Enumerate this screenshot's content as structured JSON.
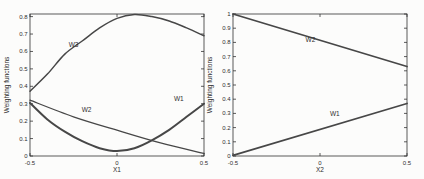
{
  "figure": {
    "background": "#fcfcfb",
    "axis_color": "#333333",
    "curve_color": "#474747",
    "text_color": "#2e2e2e"
  },
  "chart_data": [
    {
      "type": "line",
      "title": "",
      "xlabel": "X1",
      "ylabel": "Weighting functions",
      "xlim": [
        -0.5,
        0.5
      ],
      "ylim": [
        0,
        0.815
      ],
      "grid": false,
      "legend": "none",
      "xticks": [
        {
          "v": -0.5,
          "label": "-0.5"
        },
        {
          "v": 0,
          "label": "0"
        },
        {
          "v": 0.5,
          "label": "0.5"
        }
      ],
      "yticks": [
        {
          "v": 0,
          "label": "0"
        },
        {
          "v": 0.1,
          "label": "0.1"
        },
        {
          "v": 0.2,
          "label": "0.2"
        },
        {
          "v": 0.3,
          "label": "0.3"
        },
        {
          "v": 0.4,
          "label": "0.4"
        },
        {
          "v": 0.5,
          "label": "0.5"
        },
        {
          "v": 0.6,
          "label": "0.6"
        },
        {
          "v": 0.7,
          "label": "0.7"
        },
        {
          "v": 0.8,
          "label": "0.8"
        }
      ],
      "series": [
        {
          "name": "W3",
          "lw": 1.5,
          "x": [
            -0.5,
            -0.4,
            -0.3,
            -0.2,
            -0.1,
            0,
            0.1,
            0.2,
            0.3,
            0.4,
            0.5
          ],
          "y": [
            0.372,
            0.47,
            0.585,
            0.66,
            0.735,
            0.79,
            0.812,
            0.8,
            0.775,
            0.735,
            0.69
          ]
        },
        {
          "name": "W2",
          "lw": 1.3,
          "x": [
            -0.5,
            -0.25,
            0,
            0.25,
            0.5
          ],
          "y": [
            0.32,
            0.225,
            0.148,
            0.075,
            0.015
          ]
        },
        {
          "name": "W1",
          "lw": 2,
          "x": [
            -0.5,
            -0.4,
            -0.3,
            -0.2,
            -0.1,
            0,
            0.1,
            0.2,
            0.3,
            0.4,
            0.5
          ],
          "y": [
            0.305,
            0.21,
            0.14,
            0.085,
            0.045,
            0.028,
            0.045,
            0.09,
            0.15,
            0.225,
            0.3
          ]
        }
      ],
      "annotations": [
        {
          "text": "W3",
          "x": -0.25,
          "y": 0.625
        },
        {
          "text": "W2",
          "x": -0.175,
          "y": 0.25
        },
        {
          "text": "W1",
          "x": 0.355,
          "y": 0.315
        }
      ]
    },
    {
      "type": "line",
      "title": "",
      "xlabel": "X2",
      "ylabel": "Weighting functions",
      "xlim": [
        -0.5,
        0.5
      ],
      "ylim": [
        0,
        1
      ],
      "grid": false,
      "legend": "none",
      "xticks": [
        {
          "v": -0.5,
          "label": "-0.5"
        },
        {
          "v": 0,
          "label": "0"
        },
        {
          "v": 0.5,
          "label": "0.5"
        }
      ],
      "yticks": [
        {
          "v": 0,
          "label": "0"
        },
        {
          "v": 0.1,
          "label": "0.1"
        },
        {
          "v": 0.2,
          "label": "0.2"
        },
        {
          "v": 0.3,
          "label": "0.3"
        },
        {
          "v": 0.4,
          "label": "0.4"
        },
        {
          "v": 0.5,
          "label": "0.5"
        },
        {
          "v": 0.6,
          "label": "0.6"
        },
        {
          "v": 0.7,
          "label": "0.7"
        },
        {
          "v": 0.8,
          "label": "0.8"
        },
        {
          "v": 0.9,
          "label": "0.9"
        },
        {
          "v": 1,
          "label": "1"
        }
      ],
      "series": [
        {
          "name": "W2",
          "lw": 1.8,
          "x": [
            -0.5,
            0.5
          ],
          "y": [
            1.0,
            0.63
          ]
        },
        {
          "name": "W1",
          "lw": 1.8,
          "x": [
            -0.5,
            0.5
          ],
          "y": [
            0.005,
            0.37
          ]
        }
      ],
      "annotations": [
        {
          "text": "W2",
          "x": -0.055,
          "y": 0.805
        },
        {
          "text": "W1",
          "x": 0.085,
          "y": 0.28
        }
      ]
    }
  ]
}
